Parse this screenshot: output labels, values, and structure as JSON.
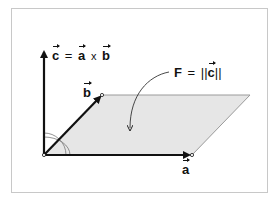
{
  "diagram": {
    "type": "cross-product-parallelogram",
    "colors": {
      "arrow": "#111111",
      "parallelogram_fill": "#e6e6e6",
      "parallelogram_stroke": "#9a9a9a",
      "frame_border": "#c8c8c8",
      "angle_arc": "#777777"
    },
    "labels": {
      "c_formula": {
        "lhs": "c",
        "eq": "=",
        "a": "a",
        "times": "x",
        "b": "b"
      },
      "area_formula": {
        "F": "F",
        "eq": "=",
        "norm_open": "||",
        "c": "c",
        "norm_close": "||"
      },
      "vector_b": "b",
      "vector_a": "a"
    },
    "vectors": [
      {
        "name": "a",
        "from": [
          44,
          155
        ],
        "to": [
          192,
          155
        ]
      },
      {
        "name": "b",
        "from": [
          44,
          155
        ],
        "to": [
          102,
          95
        ]
      },
      {
        "name": "c",
        "from": [
          44,
          155
        ],
        "to": [
          44,
          50
        ]
      }
    ],
    "parallelogram": [
      [
        44,
        155
      ],
      [
        192,
        155
      ],
      [
        250,
        95
      ],
      [
        102,
        95
      ]
    ]
  }
}
